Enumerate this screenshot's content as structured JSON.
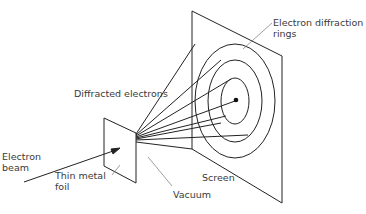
{
  "labels": {
    "rings_line1": "Electron diffraction",
    "rings_line2": "rings",
    "diffracted": "Diffracted electrons",
    "beam_line1": "Electron",
    "beam_line2": "beam",
    "foil_line1": "Thin metal",
    "foil_line2": "foil",
    "vacuum": "Vacuum",
    "screen": "Screen"
  }
}
